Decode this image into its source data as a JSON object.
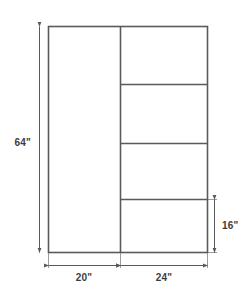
{
  "diagram": {
    "units": "inches",
    "line_color": "#5a5a5a",
    "text_color": "#3d3d3d",
    "background": "#ffffff",
    "outline": {
      "label": "cabinet-outline",
      "width_in": 44,
      "height_in": 64
    },
    "sections": [
      {
        "name": "left-tall-section",
        "width_in": 20,
        "height_in": 64,
        "shelves": 0
      },
      {
        "name": "right-shelved-section",
        "width_in": 24,
        "height_in": 64,
        "shelves": 3
      }
    ],
    "compartments": [
      {
        "name": "right-compartment-1",
        "order": 1
      },
      {
        "name": "right-compartment-2",
        "order": 2
      },
      {
        "name": "right-compartment-3",
        "order": 3
      },
      {
        "name": "right-compartment-4",
        "order": 4
      }
    ],
    "dimensions": {
      "height_left": {
        "value": "64\"",
        "orientation": "vertical",
        "side": "left"
      },
      "width_left": {
        "value": "20\"",
        "orientation": "horizontal",
        "side": "bottom"
      },
      "width_right": {
        "value": "24\"",
        "orientation": "horizontal",
        "side": "bottom"
      },
      "height_bottom_right": {
        "value": "16\"",
        "orientation": "vertical",
        "side": "right"
      }
    }
  }
}
